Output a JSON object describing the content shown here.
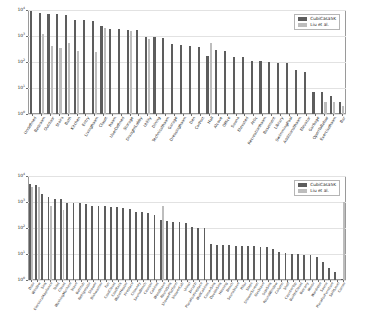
{
  "figure": {
    "legend": {
      "series": [
        {
          "key": "cubicasa5k",
          "label": "CubiCasa5K",
          "color": "#5d5d5d"
        },
        {
          "key": "liu",
          "label": "Liu et al.",
          "color": "#bdbdbd"
        }
      ]
    },
    "yticks": [
      "10^0",
      "10^1",
      "10^2",
      "10^3",
      "10^4"
    ]
  },
  "chart_data": [
    {
      "type": "bar",
      "id": "room-class-distribution",
      "title": "",
      "xlabel": "",
      "ylabel": "",
      "yscale": "log",
      "ylim": [
        1,
        10000
      ],
      "ytick_labels": [
        "10^0",
        "10^1",
        "10^2",
        "10^3",
        "10^4"
      ],
      "grid": true,
      "legend_position": "upper right",
      "categories": [
        "Undefined",
        "Bedroom",
        "Outdoor",
        "Stairs",
        "Bath",
        "Kitchen",
        "Entry",
        "LivingRoom",
        "Closet",
        "Room",
        "UserDefined",
        "Storage",
        "DraughtLobby",
        "Utility",
        "Dining",
        "TechnicalRoom",
        "Garage",
        "DressingRoom",
        "Den",
        "CarPort",
        "Hall",
        "Alcove",
        "Office",
        "Sauna",
        "Elevated",
        "Attic",
        "RecreationRoom",
        "Basement",
        "Library",
        "SwimmingPool",
        "AdditionalRoom",
        "Elevator",
        "Garbage",
        "OpenToBelow",
        "ExerciseRoom",
        "Bar"
      ],
      "series": [
        {
          "name": "CubiCasa5K",
          "color": "#5d5d5d",
          "values": [
            9200,
            7600,
            7300,
            7200,
            6300,
            4100,
            4000,
            3700,
            2500,
            1900,
            1800,
            1750,
            1700,
            900,
            880,
            850,
            490,
            450,
            420,
            380,
            170,
            280,
            260,
            150,
            150,
            110,
            110,
            100,
            95,
            88,
            50,
            42,
            7,
            7,
            5,
            3
          ]
        },
        {
          "name": "Liu et al.",
          "color": "#bdbdbd",
          "values": [
            null,
            1200,
            430,
            350,
            520,
            260,
            null,
            240,
            2000,
            null,
            null,
            1600,
            null,
            760,
            null,
            null,
            null,
            null,
            null,
            null,
            520,
            null,
            null,
            null,
            null,
            null,
            null,
            null,
            null,
            null,
            null,
            null,
            null,
            3,
            3,
            2
          ]
        }
      ]
    },
    {
      "type": "bar",
      "id": "icon-class-distribution",
      "title": "",
      "xlabel": "",
      "ylabel": "",
      "yscale": "log",
      "ylim": [
        1,
        10000
      ],
      "ytick_labels": [
        "10^0",
        "10^1",
        "10^2",
        "10^3",
        "10^4"
      ],
      "grid": true,
      "legend_position": "upper right",
      "categories": [
        "Door",
        "Window",
        "Sink",
        "ElectricalAppliance",
        "Toilet",
        "Closet",
        "WashingMachine",
        "Stove",
        "Bathtub",
        "Refrigerator",
        "Shower",
        "Dishwasher",
        "Fan",
        "CoatCloset",
        "CoatRack",
        "WaterHeater",
        "Fireplace",
        "Chimney",
        "SaunaBench",
        "Counter",
        "Cabinet",
        "WoodStove",
        "RoundSink",
        "ShowerPlatform",
        "ShowerCab",
        "Urinal",
        "Jacuzzi",
        "PlaceForFireplace",
        "WallCabinet",
        "CornerSink",
        "DoubleSink",
        "Housing",
        "Bench",
        "SaunaStove",
        "Pillar",
        "Steps",
        "ShowerScreen",
        "GasStove",
        "SideSink",
        "RoundWindow",
        "Column",
        "Shelf",
        "CounterTop",
        "BuiltInCloset",
        "Balcony",
        "Mirror",
        "Wardrobe",
        "Sauna",
        "PlaceForFurniture",
        "SplitLevel",
        "Corner"
      ],
      "series": [
        {
          "name": "CubiCasa5K",
          "color": "#5d5d5d",
          "values": [
            4900,
            4700,
            2000,
            1500,
            1300,
            1250,
            950,
            900,
            880,
            850,
            700,
            690,
            680,
            670,
            660,
            600,
            560,
            430,
            400,
            390,
            330,
            200,
            180,
            170,
            165,
            160,
            105,
            100,
            100,
            24,
            23,
            22,
            22,
            21,
            21,
            20,
            20,
            19,
            18,
            15,
            12,
            11,
            10,
            10,
            9,
            9,
            8,
            5,
            3,
            2,
            1
          ]
        },
        {
          "name": "Liu et al.",
          "color": "#bdbdbd",
          "values": [
            3800,
            3900,
            null,
            700,
            null,
            500,
            null,
            null,
            null,
            null,
            null,
            null,
            null,
            null,
            null,
            null,
            null,
            null,
            null,
            null,
            null,
            700,
            null,
            null,
            null,
            null,
            null,
            null,
            null,
            null,
            null,
            null,
            null,
            null,
            null,
            null,
            null,
            null,
            null,
            null,
            null,
            null,
            null,
            null,
            null,
            null,
            null,
            null,
            null,
            null,
            1000
          ]
        }
      ]
    }
  ]
}
